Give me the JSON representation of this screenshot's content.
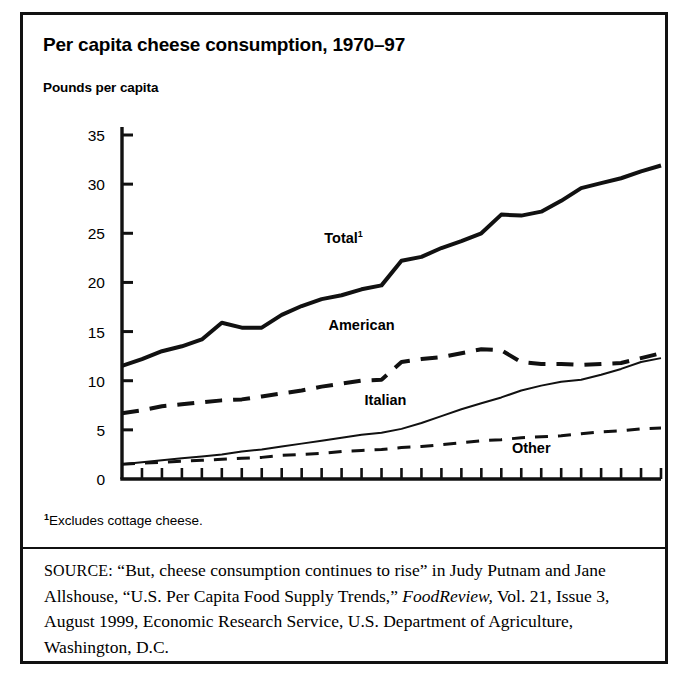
{
  "figure": {
    "title": "Per capita cheese consumption, 1970–97",
    "axis_note": "Pounds per capita",
    "footnote_marker": "1",
    "footnote_text": "Excludes cottage cheese.",
    "source_label": "SOURCE:",
    "source_part1": " “But, cheese consumption continues to rise” in Judy Putnam and Jane Allshouse, “U.S. Per Capita Food Supply Trends,” ",
    "source_italic": "FoodReview,",
    "source_part2": " Vol. 21, Issue 3, August 1999, Economic Research Service, U.S. Department of Agriculture, Washington, D.C."
  },
  "chart_data": {
    "type": "line",
    "title": "Per capita cheese consumption, 1970–97",
    "xlabel": "",
    "ylabel": "Pounds per capita",
    "xlim": [
      1970,
      1997
    ],
    "ylim": [
      0,
      35
    ],
    "ytick_step": 5,
    "grid": false,
    "legend": "inline-labels",
    "x": [
      1970,
      1971,
      1972,
      1973,
      1974,
      1975,
      1976,
      1977,
      1978,
      1979,
      1980,
      1981,
      1982,
      1983,
      1984,
      1985,
      1986,
      1987,
      1988,
      1989,
      1990,
      1991,
      1992,
      1993,
      1994,
      1995,
      1996,
      1997
    ],
    "xticks": [
      1970,
      1971,
      1972,
      1973,
      1974,
      1975,
      1976,
      1977,
      1978,
      1979,
      1980,
      1981,
      1982,
      1983,
      1984,
      1985,
      1986,
      1987,
      1988,
      1989,
      1990,
      1991,
      1992,
      1993,
      1994,
      1995,
      1996,
      1997
    ],
    "xtick_labels": [
      {
        "value": 1970,
        "label": "1970"
      },
      {
        "value": 1975,
        "label": "75"
      },
      {
        "value": 1980,
        "label": "80"
      },
      {
        "value": 1985,
        "label": "85"
      },
      {
        "value": 1990,
        "label": "90"
      },
      {
        "value": 1995,
        "label": "95"
      }
    ],
    "ytick_labels": [
      "0",
      "5",
      "10",
      "15",
      "20",
      "25",
      "30",
      "35"
    ],
    "yticks": [
      0,
      5,
      10,
      15,
      20,
      25,
      30,
      35
    ],
    "series": [
      {
        "name": "Total",
        "label": "Total",
        "label_superscript": "1",
        "style": "solid",
        "width": 4,
        "values": [
          11.5,
          12.2,
          13.0,
          13.5,
          14.2,
          15.9,
          15.4,
          15.4,
          16.7,
          17.6,
          18.3,
          18.7,
          19.3,
          19.7,
          22.2,
          22.6,
          23.5,
          24.2,
          25.0,
          26.9,
          26.8,
          27.2,
          28.3,
          29.6,
          30.1,
          30.6,
          31.3,
          31.9
        ]
      },
      {
        "name": "American",
        "label": "American",
        "style": "dashed",
        "width": 4,
        "values": [
          6.7,
          7.0,
          7.4,
          7.6,
          7.8,
          8.0,
          8.1,
          8.4,
          8.7,
          9.0,
          9.4,
          9.7,
          10.0,
          10.1,
          11.9,
          12.2,
          12.4,
          12.8,
          13.2,
          13.1,
          11.9,
          11.7,
          11.7,
          11.6,
          11.7,
          11.8,
          12.3,
          12.8
        ]
      },
      {
        "name": "Italian",
        "label": "Italian",
        "style": "solid",
        "width": 2,
        "values": [
          1.5,
          1.7,
          1.9,
          2.1,
          2.3,
          2.5,
          2.8,
          3.0,
          3.3,
          3.6,
          3.9,
          4.2,
          4.5,
          4.7,
          5.1,
          5.7,
          6.4,
          7.1,
          7.7,
          8.3,
          9.0,
          9.5,
          9.9,
          10.1,
          10.6,
          11.2,
          11.9,
          12.3
        ]
      },
      {
        "name": "Other",
        "label": "Other",
        "style": "dashed",
        "width": 3,
        "values": [
          1.5,
          1.6,
          1.7,
          1.8,
          1.9,
          2.0,
          2.1,
          2.2,
          2.4,
          2.5,
          2.6,
          2.8,
          2.9,
          3.0,
          3.2,
          3.3,
          3.5,
          3.7,
          3.9,
          4.0,
          4.2,
          4.3,
          4.4,
          4.6,
          4.8,
          4.9,
          5.1,
          5.2
        ]
      }
    ],
    "annotations": [
      {
        "text": "Total",
        "superscript": "1",
        "x": 1981.1,
        "y": 24.0
      },
      {
        "text": "American",
        "x": 1982.0,
        "y": 15.2
      },
      {
        "text": "Italian",
        "x": 1983.2,
        "y": 7.5
      },
      {
        "text": "Other",
        "x": 1990.5,
        "y": 2.6
      }
    ]
  },
  "colors": {
    "ink": "#111111",
    "background": "#ffffff"
  }
}
